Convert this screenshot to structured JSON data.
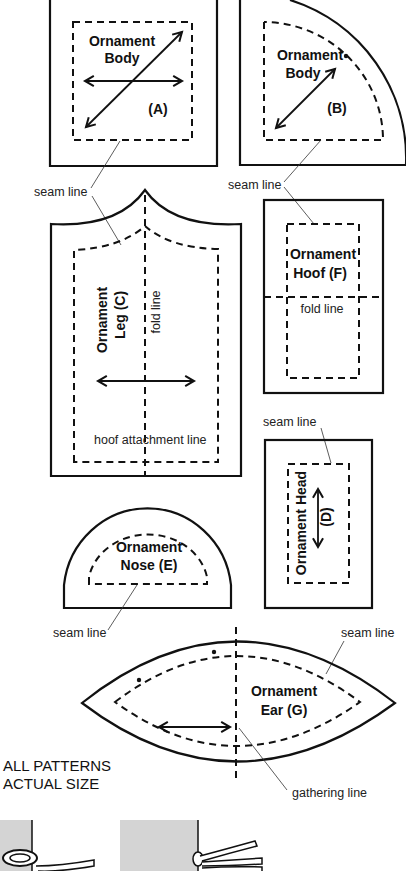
{
  "pieces": {
    "body_a": {
      "title": "Ornament",
      "title2": "Body",
      "code": "(A)"
    },
    "body_b": {
      "title": "Ornament",
      "title2": "Body",
      "code": "(B)"
    },
    "leg_c": {
      "title": "Ornament",
      "title2": "Leg (C)",
      "fold": "fold line",
      "hoof_line": "hoof attachment line"
    },
    "hoof_f": {
      "title": "Ornament",
      "title2": "Hoof (F)",
      "fold": "fold line"
    },
    "head_d": {
      "title": "Ornament Head",
      "code": "(D)"
    },
    "nose_e": {
      "title": "Ornament",
      "title2": "Nose (E)"
    },
    "ear_g": {
      "title": "Ornament",
      "title2": "Ear (G)",
      "gathering": "gathering line"
    }
  },
  "labels": {
    "seam_line": "seam line",
    "note_line1": "ALL PATTERNS",
    "note_line2": "ACTUAL SIZE"
  },
  "icons": [
    "grainline-arrow",
    "knot-illustration"
  ],
  "colors": {
    "ink": "#111111",
    "paper": "#ffffff",
    "shade": "#d4d4d4"
  }
}
